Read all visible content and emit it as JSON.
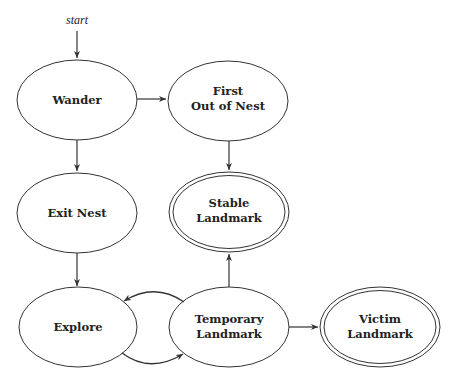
{
  "diagram": {
    "type": "state-machine",
    "start_label": "start",
    "states": [
      {
        "id": "wander",
        "lines": [
          "Wander"
        ],
        "accepting": false
      },
      {
        "id": "first_out",
        "lines": [
          "First",
          "Out of Nest"
        ],
        "accepting": false
      },
      {
        "id": "exit_nest",
        "lines": [
          "Exit Nest"
        ],
        "accepting": false
      },
      {
        "id": "stable",
        "lines": [
          "Stable",
          "Landmark"
        ],
        "accepting": true
      },
      {
        "id": "explore",
        "lines": [
          "Explore"
        ],
        "accepting": false
      },
      {
        "id": "temporary",
        "lines": [
          "Temporary",
          "Landmark"
        ],
        "accepting": false
      },
      {
        "id": "victim",
        "lines": [
          "Victim",
          "Landmark"
        ],
        "accepting": true
      }
    ],
    "transitions": [
      {
        "from": "start",
        "to": "wander"
      },
      {
        "from": "wander",
        "to": "first_out"
      },
      {
        "from": "wander",
        "to": "exit_nest"
      },
      {
        "from": "first_out",
        "to": "stable"
      },
      {
        "from": "exit_nest",
        "to": "explore"
      },
      {
        "from": "explore",
        "to": "temporary"
      },
      {
        "from": "temporary",
        "to": "explore"
      },
      {
        "from": "temporary",
        "to": "stable"
      },
      {
        "from": "temporary",
        "to": "victim"
      }
    ],
    "colors": {
      "stroke": "#333333",
      "text": "#222222",
      "background": "#ffffff"
    }
  },
  "labels": {
    "start": "start",
    "wander": "Wander",
    "first_out_1": "First",
    "first_out_2": "Out of Nest",
    "exit_nest": "Exit Nest",
    "stable_1": "Stable",
    "stable_2": "Landmark",
    "explore": "Explore",
    "temporary_1": "Temporary",
    "temporary_2": "Landmark",
    "victim_1": "Victim",
    "victim_2": "Landmark"
  }
}
